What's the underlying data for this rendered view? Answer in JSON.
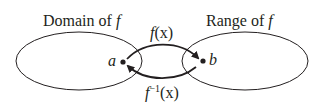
{
  "domain_label": {
    "text": "Domain of ",
    "func": "f"
  },
  "range_label": {
    "text": "Range of ",
    "func": "f"
  },
  "point_a": "a",
  "point_b": "b",
  "forward_arrow": {
    "func": "f",
    "arg": "(x)"
  },
  "inverse_arrow": {
    "func": "f",
    "sup": "−1",
    "arg": "(x)"
  },
  "colors": {
    "stroke": "#231f20",
    "background": "#ffffff"
  }
}
